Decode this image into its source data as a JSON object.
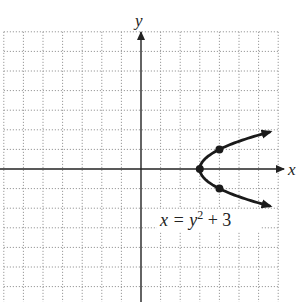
{
  "diagram": {
    "type": "coordinate-graph",
    "axes": {
      "x_label": "x",
      "y_label": "y",
      "origin_px": [
        141,
        169
      ],
      "unit_px": 19.6,
      "x_range": [
        -7,
        7
      ],
      "y_range": [
        -6,
        7
      ]
    },
    "grid": {
      "style": "dotted",
      "color": "#9a9a9a"
    },
    "curve": {
      "equation_label": "x = y",
      "equation_exponent": "2",
      "equation_tail": " + 3",
      "equation": "x = y^2 + 3",
      "color": "#1a1a1a",
      "points": [
        {
          "x": 3,
          "y": 0
        },
        {
          "x": 4,
          "y": 1
        },
        {
          "x": 4,
          "y": -1
        }
      ]
    }
  }
}
